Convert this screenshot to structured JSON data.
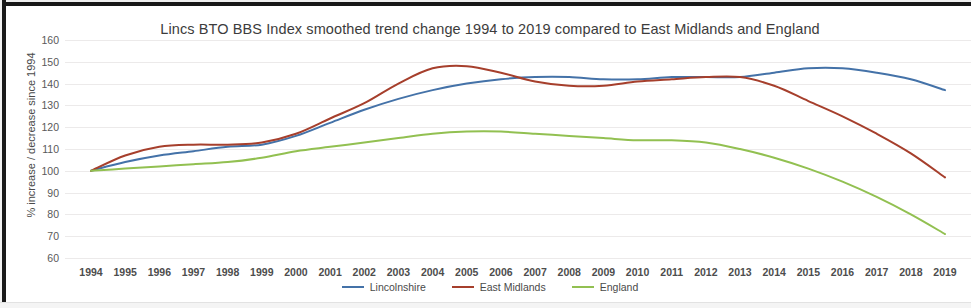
{
  "chart_data": {
    "type": "line",
    "title": "Lincs BTO BBS Index smoothed trend change 1994 to 2019 compared to East Midlands and England",
    "xlabel": "",
    "ylabel": "% increase / decrease since 1994",
    "ylim": [
      60,
      160
    ],
    "ytick_step": 10,
    "yticks": [
      160,
      150,
      140,
      130,
      120,
      110,
      100,
      90,
      80,
      70,
      60
    ],
    "grid": true,
    "legend_position": "bottom-center",
    "categories": [
      "1994",
      "1995",
      "1996",
      "1997",
      "1998",
      "1999",
      "2000",
      "2001",
      "2002",
      "2003",
      "2004",
      "2005",
      "2006",
      "2007",
      "2008",
      "2009",
      "2010",
      "2011",
      "2012",
      "2013",
      "2014",
      "2015",
      "2016",
      "2017",
      "2018",
      "2019"
    ],
    "series": [
      {
        "name": "Lincolnshire",
        "color": "#4472a8",
        "values": [
          100,
          104,
          107,
          109,
          111,
          112,
          116,
          122,
          128,
          133,
          137,
          140,
          142,
          143,
          143,
          142,
          142,
          143,
          143,
          143,
          145,
          147,
          147,
          145,
          142,
          137
        ]
      },
      {
        "name": "East Midlands",
        "color": "#a63f2c",
        "values": [
          100,
          107,
          111,
          112,
          112,
          113,
          117,
          124,
          131,
          140,
          147,
          148,
          145,
          141,
          139,
          139,
          141,
          142,
          143,
          143,
          139,
          132,
          125,
          117,
          108,
          97
        ]
      },
      {
        "name": "England",
        "color": "#92c051",
        "values": [
          100,
          101,
          102,
          103,
          104,
          106,
          109,
          111,
          113,
          115,
          117,
          118,
          118,
          117,
          116,
          115,
          114,
          114,
          113,
          110,
          106,
          101,
          95,
          88,
          80,
          71
        ]
      }
    ]
  },
  "legend": {
    "items": [
      {
        "label": "Lincolnshire",
        "color": "#4472a8"
      },
      {
        "label": "East Midlands",
        "color": "#a63f2c"
      },
      {
        "label": "England",
        "color": "#92c051"
      }
    ]
  }
}
